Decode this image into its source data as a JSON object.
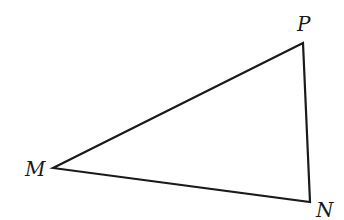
{
  "diagram": {
    "type": "triangle",
    "vertices": [
      {
        "label": "P",
        "x": 303,
        "y": 43
      },
      {
        "label": "M",
        "x": 53,
        "y": 168
      },
      {
        "label": "N",
        "x": 310,
        "y": 202
      }
    ],
    "edges": [
      [
        "M",
        "P"
      ],
      [
        "P",
        "N"
      ],
      [
        "N",
        "M"
      ]
    ],
    "stroke_color": "#1a1a1a",
    "background": "#ffffff"
  }
}
